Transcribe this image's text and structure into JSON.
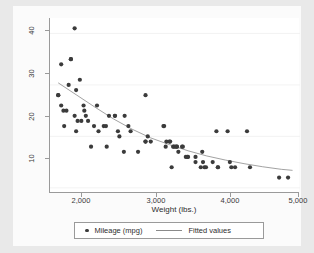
{
  "chart_data": {
    "type": "scatter",
    "title": "",
    "xlabel": "Weight (lbs.)",
    "ylabel": "",
    "xlim": [
      1650,
      5000
    ],
    "ylim": [
      9,
      43
    ],
    "xticks": [
      2000,
      3000,
      4000,
      5000
    ],
    "xticklabels": [
      "2,000",
      "3,000",
      "4,000",
      "5,000"
    ],
    "yticks": [
      10,
      20,
      30,
      40
    ],
    "yticklabels": [
      "10",
      "20",
      "30",
      "40"
    ],
    "grid": "horizontal-faint",
    "legend_position": "bottom",
    "series": [
      {
        "name": "Mileage (mpg)",
        "type": "scatter",
        "marker": "circle",
        "color": "#3b3b3b",
        "points": [
          [
            1760,
            28
          ],
          [
            1760,
            28
          ],
          [
            1800,
            34
          ],
          [
            1800,
            26
          ],
          [
            1830,
            25
          ],
          [
            1840,
            22
          ],
          [
            1870,
            25
          ],
          [
            1900,
            30
          ],
          [
            1930,
            35
          ],
          [
            1930,
            35
          ],
          [
            1980,
            41
          ],
          [
            1980,
            24
          ],
          [
            2000,
            29
          ],
          [
            2000,
            21
          ],
          [
            2020,
            23
          ],
          [
            2050,
            31
          ],
          [
            2070,
            23
          ],
          [
            2100,
            26
          ],
          [
            2110,
            25
          ],
          [
            2130,
            24
          ],
          [
            2160,
            23
          ],
          [
            2200,
            18
          ],
          [
            2240,
            22
          ],
          [
            2280,
            26
          ],
          [
            2300,
            21
          ],
          [
            2370,
            22
          ],
          [
            2400,
            22
          ],
          [
            2410,
            18
          ],
          [
            2440,
            24
          ],
          [
            2520,
            24
          ],
          [
            2520,
            24
          ],
          [
            2560,
            21
          ],
          [
            2580,
            20
          ],
          [
            2640,
            17
          ],
          [
            2650,
            24
          ],
          [
            2700,
            22
          ],
          [
            2730,
            21
          ],
          [
            2830,
            17
          ],
          [
            2930,
            28
          ],
          [
            2930,
            19
          ],
          [
            2930,
            19
          ],
          [
            2960,
            20
          ],
          [
            3000,
            19
          ],
          [
            3170,
            22
          ],
          [
            3180,
            22
          ],
          [
            3200,
            18
          ],
          [
            3210,
            19
          ],
          [
            3250,
            19
          ],
          [
            3260,
            19
          ],
          [
            3280,
            14
          ],
          [
            3300,
            18
          ],
          [
            3310,
            18
          ],
          [
            3330,
            18
          ],
          [
            3350,
            18
          ],
          [
            3350,
            18
          ],
          [
            3370,
            17
          ],
          [
            3420,
            18
          ],
          [
            3430,
            18
          ],
          [
            3470,
            16
          ],
          [
            3490,
            16
          ],
          [
            3500,
            16
          ],
          [
            3600,
            16
          ],
          [
            3600,
            15
          ],
          [
            3670,
            14
          ],
          [
            3690,
            17
          ],
          [
            3700,
            15
          ],
          [
            3720,
            14
          ],
          [
            3740,
            14
          ],
          [
            3830,
            15
          ],
          [
            3880,
            21
          ],
          [
            3900,
            14
          ],
          [
            3900,
            14
          ],
          [
            4030,
            21
          ],
          [
            4060,
            15
          ],
          [
            4080,
            14
          ],
          [
            4130,
            14
          ],
          [
            4290,
            21
          ],
          [
            4330,
            14
          ],
          [
            4720,
            12
          ],
          [
            4840,
            12
          ]
        ]
      },
      {
        "name": "Fitted values",
        "type": "line",
        "color": "#8a8a8a",
        "points": [
          [
            1760,
            30.4
          ],
          [
            2000,
            28.1
          ],
          [
            2250,
            25.7
          ],
          [
            2500,
            23.4
          ],
          [
            2750,
            21.4
          ],
          [
            3000,
            19.7
          ],
          [
            3250,
            18.4
          ],
          [
            3500,
            17.2
          ],
          [
            3750,
            16.2
          ],
          [
            4000,
            15.4
          ],
          [
            4250,
            14.7
          ],
          [
            4500,
            14.1
          ],
          [
            4750,
            13.6
          ],
          [
            4900,
            13.4
          ]
        ]
      }
    ]
  },
  "legend": {
    "entries": [
      {
        "label": "Mileage (mpg)",
        "marker": "circle-marker-icon"
      },
      {
        "label": "Fitted values",
        "marker": "line-marker-icon"
      }
    ]
  }
}
